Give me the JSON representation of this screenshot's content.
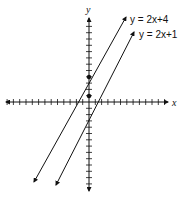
{
  "chart_data": {
    "type": "line",
    "title": "",
    "xlabel": "x",
    "ylabel": "y",
    "grid": false,
    "axis_ticks": {
      "spacing_units": 1,
      "x_range": [
        -13,
        12
      ],
      "y_range": [
        -14,
        12
      ]
    },
    "series": [
      {
        "name": "y = 2x+4",
        "slope": 2,
        "intercept": 4,
        "y_intercept_point": [
          0,
          4
        ]
      },
      {
        "name": "y = 2x+1",
        "slope": 2,
        "intercept": 1,
        "y_intercept_point": [
          0,
          1
        ]
      }
    ],
    "annotations": [
      "y = 2x+4",
      "y = 2x+1"
    ]
  },
  "labels": {
    "x_axis": "x",
    "y_axis": "y",
    "line1": "y = 2x+4",
    "line2": "y = 2x+1"
  },
  "colors": {
    "ink": "#111111",
    "background": "#ffffff"
  }
}
